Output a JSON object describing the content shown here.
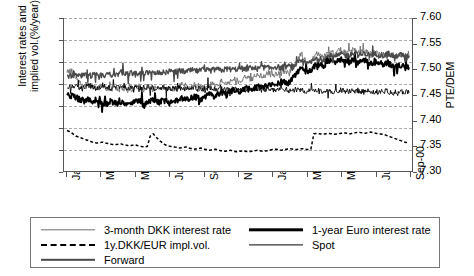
{
  "chart_data": {
    "type": "line",
    "title": "",
    "xlabel": "",
    "ylabel": "Interest rates and implied vol.(%/year)",
    "ylabel_line1": "Interest rates and",
    "ylabel_line2": "implied vol.(%/year)",
    "y2label": "PTE/DEM",
    "grid": true,
    "legend_position": "bottom",
    "ylim": [
      0,
      7
    ],
    "yticks": [
      "0",
      "1",
      "2",
      "3",
      "4",
      "5",
      "6",
      "7"
    ],
    "y2lim": [
      7.3,
      7.6
    ],
    "y2ticks": [
      "7.30",
      "7.35",
      "7.40",
      "7.45",
      "7.50",
      "7.55",
      "7.60"
    ],
    "xticks": [
      "Jan-99",
      "Mar-99",
      "May-99",
      "Jul-99",
      "Sep-99",
      "Nov-99",
      "Jan-00",
      "Mar-00",
      "May-00",
      "Jul-00",
      "Sep-00"
    ],
    "series": [
      {
        "name": "3-month DKK interest rate",
        "axis": "left",
        "style": "thin-gray",
        "color": "#6e6e6e",
        "values": [
          4.6,
          4.55,
          4.4,
          4.25,
          4.1,
          4.05,
          3.95,
          4.0,
          3.9,
          3.85,
          3.8,
          3.95,
          3.85,
          3.75,
          3.8,
          3.9,
          3.8,
          3.7,
          3.75,
          3.8,
          3.7,
          3.65,
          3.7,
          3.8,
          3.9,
          3.75,
          3.7,
          3.75,
          3.8,
          3.85,
          3.75,
          3.7,
          3.8,
          3.9,
          3.8,
          3.75,
          3.7,
          3.8,
          3.9,
          4.0,
          3.9,
          3.8,
          3.85,
          3.95,
          3.9,
          3.85,
          3.8,
          3.9,
          4.0,
          3.95,
          3.9,
          4.0,
          4.1,
          4.05,
          4.0,
          4.1,
          4.2,
          4.15,
          4.1,
          4.2,
          4.3,
          4.25,
          4.2,
          4.3,
          4.4,
          4.35,
          4.3,
          4.4,
          4.5,
          4.45,
          4.4,
          4.5,
          4.6,
          4.55,
          4.5,
          4.6,
          4.75,
          4.9,
          5.2,
          5.35,
          5.1,
          4.95,
          5.05,
          5.2,
          5.35,
          5.3,
          5.2,
          5.35,
          5.5,
          5.45,
          5.35,
          5.45,
          5.55,
          5.5,
          5.4,
          5.45,
          5.55,
          5.5,
          5.4,
          5.45,
          5.5,
          5.45,
          5.35,
          5.4,
          5.45,
          5.4,
          5.3,
          5.35,
          5.4,
          5.3,
          5.2,
          5.25,
          5.3,
          5.25,
          5.15,
          5.2
        ]
      },
      {
        "name": "1-year Euro interest rate",
        "axis": "left",
        "style": "thick-black",
        "color": "#000000",
        "values": [
          3.5,
          3.45,
          3.4,
          3.35,
          3.3,
          3.25,
          3.2,
          3.25,
          3.2,
          3.15,
          3.1,
          3.15,
          3.1,
          3.05,
          3.1,
          3.15,
          3.1,
          3.05,
          3.1,
          3.15,
          3.1,
          3.05,
          3.1,
          3.15,
          3.2,
          3.15,
          3.1,
          3.15,
          3.2,
          3.25,
          3.2,
          3.15,
          3.2,
          3.25,
          3.2,
          3.15,
          3.2,
          3.25,
          3.3,
          3.35,
          3.3,
          3.25,
          3.3,
          3.4,
          3.35,
          3.3,
          3.35,
          3.45,
          3.5,
          3.45,
          3.4,
          3.5,
          3.6,
          3.55,
          3.5,
          3.6,
          3.7,
          3.65,
          3.6,
          3.7,
          3.8,
          3.75,
          3.7,
          3.8,
          3.9,
          3.85,
          3.8,
          3.9,
          4.0,
          3.95,
          3.9,
          4.0,
          4.1,
          4.05,
          4.0,
          4.1,
          4.25,
          4.4,
          4.6,
          4.75,
          4.6,
          4.5,
          4.6,
          4.75,
          4.9,
          4.85,
          4.75,
          4.9,
          5.05,
          5.0,
          4.9,
          5.0,
          5.1,
          5.05,
          4.95,
          5.0,
          5.1,
          5.05,
          4.95,
          5.0,
          5.05,
          5.0,
          4.9,
          4.95,
          5.0,
          4.95,
          4.85,
          4.9,
          4.95,
          4.85,
          4.75,
          4.8,
          4.85,
          4.8,
          4.7,
          4.75
        ]
      },
      {
        "name": "Spot",
        "axis": "right",
        "style": "thin-black",
        "color": "#000000",
        "values": [
          7.465,
          7.464,
          7.466,
          7.4655,
          7.4645,
          7.4635,
          7.466,
          7.467,
          7.465,
          7.464,
          7.463,
          7.4645,
          7.466,
          7.465,
          7.4635,
          7.4625,
          7.464,
          7.4655,
          7.4645,
          7.463,
          7.462,
          7.4635,
          7.465,
          7.464,
          7.463,
          7.462,
          7.4635,
          7.465,
          7.464,
          7.4625,
          7.4615,
          7.463,
          7.4645,
          7.4635,
          7.462,
          7.461,
          7.4625,
          7.464,
          7.463,
          7.4615,
          7.4605,
          7.462,
          7.4635,
          7.4625,
          7.461,
          7.46,
          7.4615,
          7.463,
          7.462,
          7.4605,
          7.4595,
          7.461,
          7.4625,
          7.4615,
          7.46,
          7.459,
          7.4605,
          7.462,
          7.461,
          7.4595,
          7.4585,
          7.46,
          7.4615,
          7.4605,
          7.459,
          7.458,
          7.4595,
          7.461,
          7.46,
          7.4585,
          7.4575,
          7.459,
          7.4605,
          7.4595,
          7.458,
          7.457,
          7.4585,
          7.46,
          7.459,
          7.4575,
          7.4565,
          7.458,
          7.4595,
          7.4585,
          7.457,
          7.456,
          7.4575,
          7.459,
          7.458,
          7.4565,
          7.4555,
          7.457,
          7.4585,
          7.4575,
          7.456,
          7.455,
          7.4565,
          7.458,
          7.457,
          7.4555,
          7.4545,
          7.456,
          7.4575,
          7.4565,
          7.455,
          7.454,
          7.4555,
          7.457,
          7.456,
          7.4545,
          7.4535,
          7.455,
          7.4565,
          7.4555,
          7.454,
          7.453
        ]
      },
      {
        "name": "Forward",
        "axis": "right",
        "style": "med-gray",
        "color": "#4a4a4a",
        "values": [
          7.485,
          7.486,
          7.487,
          7.4865,
          7.4855,
          7.487,
          7.4885,
          7.4875,
          7.4865,
          7.488,
          7.4895,
          7.4885,
          7.4875,
          7.489,
          7.4905,
          7.4895,
          7.4885,
          7.49,
          7.4915,
          7.4905,
          7.4895,
          7.491,
          7.4925,
          7.4915,
          7.4905,
          7.492,
          7.4935,
          7.4925,
          7.4915,
          7.493,
          7.4945,
          7.4935,
          7.4925,
          7.494,
          7.4955,
          7.4945,
          7.4935,
          7.495,
          7.4965,
          7.4955,
          7.4945,
          7.496,
          7.4975,
          7.4965,
          7.4955,
          7.497,
          7.4985,
          7.4975,
          7.4965,
          7.498,
          7.4995,
          7.4985,
          7.4975,
          7.499,
          7.5005,
          7.4995,
          7.4985,
          7.5,
          7.5015,
          7.5005,
          7.4995,
          7.501,
          7.5025,
          7.5015,
          7.5005,
          7.502,
          7.5035,
          7.5025,
          7.5015,
          7.503,
          7.5045,
          7.5035,
          7.5025,
          7.504,
          7.5055,
          7.5045,
          7.506,
          7.509,
          7.513,
          7.516,
          7.512,
          7.51,
          7.513,
          7.517,
          7.521,
          7.52,
          7.518,
          7.522,
          7.526,
          7.525,
          7.523,
          7.526,
          7.529,
          7.528,
          7.526,
          7.528,
          7.53,
          7.529,
          7.527,
          7.5285,
          7.53,
          7.529,
          7.527,
          7.528,
          7.5295,
          7.5285,
          7.5265,
          7.5275,
          7.529,
          7.5275,
          7.5255,
          7.5265,
          7.528,
          7.527,
          7.525,
          7.526
        ]
      },
      {
        "name": "1y.DKK/EUR impl.vol.",
        "axis": "left",
        "style": "dashed-black",
        "color": "#000000",
        "values": [
          1.85,
          1.8,
          1.7,
          1.6,
          1.55,
          1.5,
          1.45,
          1.4,
          1.35,
          1.3,
          1.28,
          1.3,
          1.32,
          1.28,
          1.25,
          1.22,
          1.2,
          1.22,
          1.25,
          1.2,
          1.18,
          1.15,
          1.18,
          1.2,
          1.15,
          1.12,
          1.1,
          1.12,
          1.6,
          1.7,
          1.55,
          1.4,
          1.3,
          1.2,
          1.15,
          1.12,
          1.1,
          1.08,
          1.05,
          1.08,
          1.1,
          1.05,
          1.02,
          1.0,
          1.02,
          1.05,
          1.0,
          0.98,
          0.95,
          0.98,
          1.0,
          0.95,
          0.92,
          0.9,
          0.92,
          0.95,
          0.9,
          0.88,
          0.9,
          0.92,
          0.9,
          0.88,
          0.9,
          0.92,
          0.95,
          0.92,
          0.9,
          0.92,
          0.95,
          0.98,
          1.0,
          0.98,
          0.95,
          0.98,
          1.0,
          1.02,
          1.0,
          0.98,
          1.0,
          1.02,
          1.0,
          0.98,
          1.0,
          1.7,
          1.72,
          1.7,
          1.68,
          1.7,
          1.72,
          1.7,
          1.68,
          1.7,
          1.72,
          1.75,
          1.73,
          1.7,
          1.72,
          1.75,
          1.78,
          1.75,
          1.72,
          1.75,
          1.78,
          1.75,
          1.72,
          1.7,
          1.68,
          1.65,
          1.6,
          1.55,
          1.5,
          1.45,
          1.4,
          1.35,
          1.3,
          1.35
        ]
      }
    ]
  },
  "legend": {
    "items": [
      {
        "label": "3-month DKK interest rate",
        "style": "thin-gray"
      },
      {
        "label": "1y.DKK/EUR impl.vol.",
        "style": "dashed-black"
      },
      {
        "label": "Forward",
        "style": "med-gray"
      },
      {
        "label": "1-year Euro interest rate",
        "style": "thick-black"
      },
      {
        "label": "Spot",
        "style": "thin-black"
      }
    ]
  }
}
